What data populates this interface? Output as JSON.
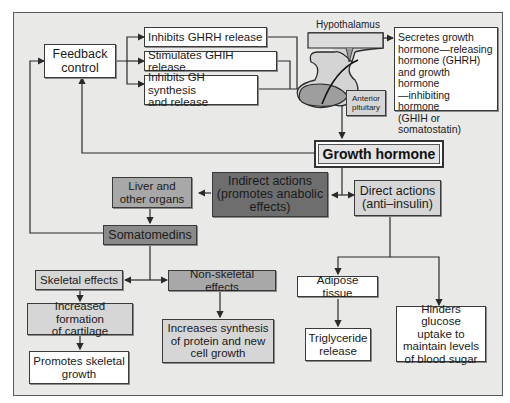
{
  "diagram": {
    "nodes": {
      "feedback": "Feedback\ncontrol",
      "inhibits_ghrh": "Inhibits GHRH release",
      "stimulates_ghih": "Stimulates GHIH release",
      "inhibits_gh": "Inhibits GH synthesis\nand release",
      "hypothalamus_label": "Hypothalamus",
      "secretes": "Secretes growth\nhormone—releasing\nhormone (GHRH)\nand growth hormone\n—inhibiting hormone\n(GHIH or\nsomatostatin)",
      "anterior_pituitary": "Anterior\npituitary",
      "growth_hormone": "Growth hormone",
      "indirect": "Indirect actions\n(promotes anabolic\neffects)",
      "direct": "Direct actions\n(anti–insulin)",
      "liver": "Liver and\nother organs",
      "somatomedins": "Somatomedins",
      "skeletal": "Skeletal effects",
      "nonskeletal": "Non-skeletal effects",
      "cartilage": "Increased formation\nof cartilage",
      "skeletal_growth": "Promotes skeletal\ngrowth",
      "protein": "Increases synthesis\nof protein and new\ncell growth",
      "adipose": "Adipose tissue",
      "triglyceride": "Triglyceride\nrelease",
      "glucose": "Hinders glucose\nuptake to\nmaintain levels\nof blood sugar"
    },
    "colors": {
      "background": "#e9e9e7",
      "box_white": "#ffffff",
      "box_mid": "#a8a8a8",
      "box_dark": "#6e6e6e",
      "box_light": "#d6d6d6",
      "line": "#2a2a2a"
    }
  }
}
